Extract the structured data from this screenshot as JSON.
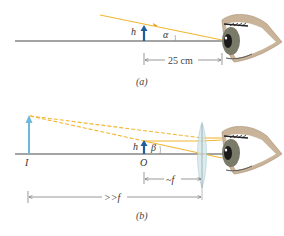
{
  "figure": {
    "panel_a": {
      "caption": "(a)",
      "object_label": "h",
      "angle_label": "α",
      "distance_label": "25 cm"
    },
    "panel_b": {
      "caption": "(b)",
      "object_label": "h",
      "angle_label": "β",
      "image_label": "I",
      "object_point_label": "O",
      "near_focal_label": "~f",
      "far_focal_label": ">>f"
    },
    "colors": {
      "axis": "#4a4a4a",
      "ray": "#f2b632",
      "object_arrow": "#1f5e9a",
      "image_arrow": "#6fb8dc",
      "lens": "#cfe6ea",
      "eye_skin": "#c9b49a",
      "iris": "#5a5a4a"
    }
  }
}
